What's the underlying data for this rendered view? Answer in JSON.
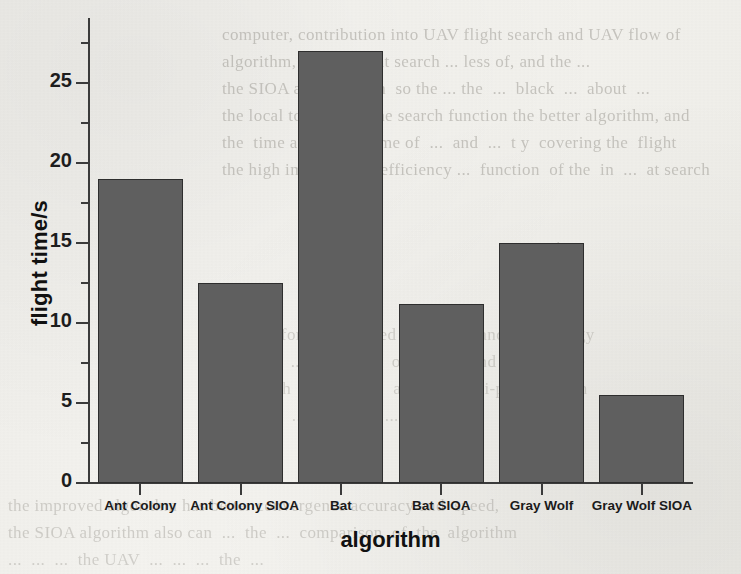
{
  "document": {
    "type": "scanned-paper-page",
    "background_color": "#f3f2ee",
    "ghost_text": {
      "right_column_lines": [
        "computer, contribution into UAV flight search and UAV flow of",
        "algorithm, let the flight search ... less of, and the ...",
        "the SIOA and it y chan  so the ... the  ...  black  ...  about  ...",
        "the local to improve the search function the better algorithm, and",
        "the  time and flight  time of  ...  and  ...  t y  covering the  flight",
        "the high improve the  efficiency ...  function  of the  in  ...  at search"
      ],
      "right_section_heading": "usion",
      "mid_column_lines": [
        "lization for an improved  search  ... and  ...  strategy",
        "and task  ...  in  the  ...  of  the  ...  and  ...  satellite",
        "...  search  ...  ...  ...  ...  and  ...  multi-point  search",
        "...  ...  ...  ...  ...  ...  ...  ..."
      ],
      "bottom_lines": [
        "the improved algorithm has better convergence accuracy and  speed,",
        "the SIOA algorithm also can  ...  the  ...  comparison  of  the  algorithm",
        "...  ...  ...  the UAV  ...  ...  ...  the  ..."
      ]
    }
  },
  "chart_data": {
    "type": "bar",
    "title": "",
    "xlabel": "algorithm",
    "ylabel": "flight time/s",
    "categories": [
      "Ant Colony",
      "Ant Colony SIOA",
      "Bat",
      "Bat SIOA",
      "Gray Wolf",
      "Gray Wolf SIOA"
    ],
    "values": [
      19.0,
      12.5,
      27.0,
      11.2,
      15.0,
      5.5
    ],
    "ylim": [
      0,
      28.5
    ],
    "y_major_ticks": [
      0,
      5,
      10,
      15,
      20,
      25
    ],
    "y_major_tick_labels": [
      "0",
      "5",
      "10",
      "15",
      "20",
      "25"
    ],
    "y_minor_ticks": [
      2.5,
      7.5,
      12.5,
      17.5,
      22.5,
      27.5
    ],
    "grid": false,
    "legend": "none",
    "bar_color": "#5f5f5f",
    "bar_edge_color": "#2e2e2e",
    "axis_color": "#3b3b3b",
    "text_color": "#1b1b1b"
  }
}
